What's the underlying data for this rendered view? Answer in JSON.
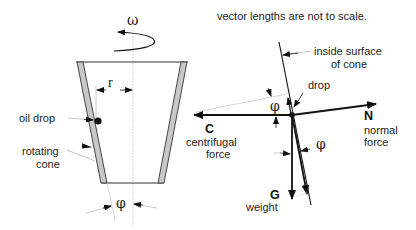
{
  "title_note": "vector lengths are not to scale.",
  "cone_figure": {
    "omega_label": "ω",
    "radius_label": "r",
    "oil_drop_label": "oil drop",
    "rotating_cone_label_line1": "rotating",
    "rotating_cone_label_line2": "cone",
    "angle_label": "φ"
  },
  "force_diagram": {
    "surface_label_line1": "inside surface",
    "surface_label_line2": "of cone",
    "drop_label": "drop",
    "angle_top_label": "φ",
    "angle_bottom_label": "φ",
    "centrifugal": {
      "symbol": "C",
      "line1": "centrifugal",
      "line2": "force"
    },
    "normal": {
      "symbol": "N",
      "line1": "normal",
      "line2": "force"
    },
    "weight": {
      "symbol": "G",
      "line1": "weight"
    }
  },
  "colors": {
    "line": "#111111",
    "cone_wall_fill": "#c8c8c8",
    "axis": "#b0b0b0",
    "leader": "#a8a8a8"
  }
}
